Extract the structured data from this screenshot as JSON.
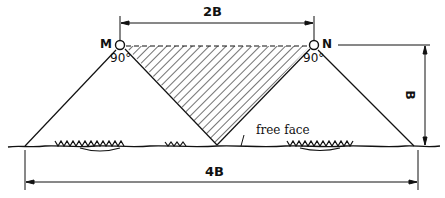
{
  "diagram": {
    "points": {
      "left": "M",
      "right": "N"
    },
    "angles": {
      "left": "90°",
      "right": "90°"
    },
    "dimensions": {
      "top": "2B",
      "bottom": "4B",
      "height": "B"
    },
    "annotation": "free face",
    "colors": {
      "ink": "#111111",
      "background": "#ffffff"
    }
  }
}
